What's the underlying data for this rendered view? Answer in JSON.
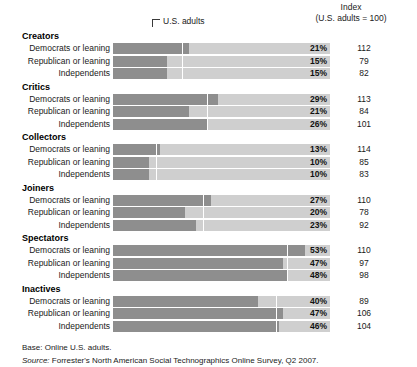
{
  "header": {
    "index_title_line1": "Index",
    "index_title_line2": "(U.S. adults = 100)",
    "callout_label": "U.S. adults"
  },
  "footer": {
    "base": "Base: Online U.S. adults.",
    "source_label": "Source:",
    "source_text": "Forrester's North American Social Technographics Online Survey, Q2 2007."
  },
  "chart_data": {
    "type": "bar",
    "title": "",
    "xlabel": "",
    "ylabel": "",
    "xlim": [
      0,
      60
    ],
    "grid": false,
    "legend": "none",
    "orientation": "horizontal",
    "value_suffix": "%",
    "reference_marker_label": "U.S. adults",
    "index_base": 100,
    "series_names": [
      "Democrats or leaning",
      "Republican or leaning",
      "Independents"
    ],
    "groups": [
      {
        "name": "Creators",
        "us_adults": 19,
        "rows": [
          {
            "label": "Democrats or leaning",
            "value": 21,
            "display": "21%",
            "index": 112
          },
          {
            "label": "Republican or leaning",
            "value": 15,
            "display": "15%",
            "index": 79
          },
          {
            "label": "Independents",
            "value": 15,
            "display": "15%",
            "index": 82
          }
        ]
      },
      {
        "name": "Critics",
        "us_adults": 26,
        "rows": [
          {
            "label": "Democrats or leaning",
            "value": 29,
            "display": "29%",
            "index": 113
          },
          {
            "label": "Republican or leaning",
            "value": 21,
            "display": "21%",
            "index": 84
          },
          {
            "label": "Independents",
            "value": 26,
            "display": "26%",
            "index": 101
          }
        ]
      },
      {
        "name": "Collectors",
        "us_adults": 12,
        "rows": [
          {
            "label": "Democrats or leaning",
            "value": 13,
            "display": "13%",
            "index": 114
          },
          {
            "label": "Republican or leaning",
            "value": 10,
            "display": "10%",
            "index": 85
          },
          {
            "label": "Independents",
            "value": 10,
            "display": "10%",
            "index": 83
          }
        ]
      },
      {
        "name": "Joiners",
        "us_adults": 25,
        "rows": [
          {
            "label": "Democrats or leaning",
            "value": 27,
            "display": "27%",
            "index": 110
          },
          {
            "label": "Republican or leaning",
            "value": 20,
            "display": "20%",
            "index": 78
          },
          {
            "label": "Independents",
            "value": 23,
            "display": "23%",
            "index": 92
          }
        ]
      },
      {
        "name": "Spectators",
        "us_adults": 48,
        "rows": [
          {
            "label": "Democrats or leaning",
            "value": 53,
            "display": "53%",
            "index": 110
          },
          {
            "label": "Republican or leaning",
            "value": 47,
            "display": "47%",
            "index": 97
          },
          {
            "label": "Independents",
            "value": 48,
            "display": "48%",
            "index": 98
          }
        ]
      },
      {
        "name": "Inactives",
        "us_adults": 45,
        "rows": [
          {
            "label": "Democrats or leaning",
            "value": 40,
            "display": "40%",
            "index": 89
          },
          {
            "label": "Republican or leaning",
            "value": 47,
            "display": "47%",
            "index": 106
          },
          {
            "label": "Independents",
            "value": 46,
            "display": "46%",
            "index": 104
          }
        ]
      }
    ]
  },
  "colors": {
    "bar_fill": "#8e8e8e",
    "bar_track": "#cfcfcf",
    "tick": "#ffffff",
    "text": "#1a1a1a"
  }
}
